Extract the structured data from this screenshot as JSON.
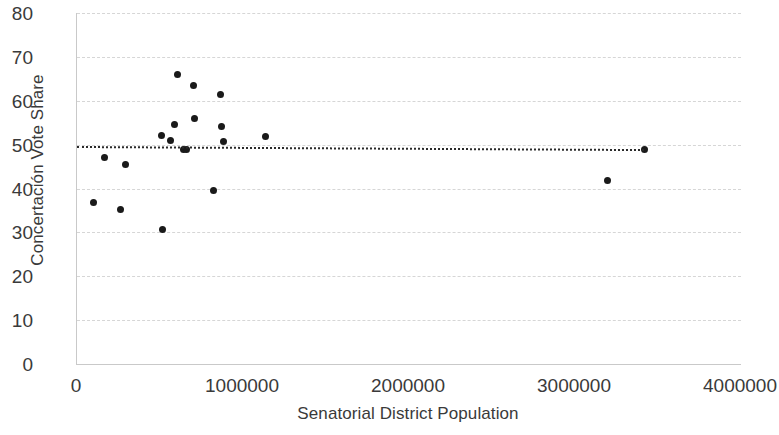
{
  "chart_data": {
    "type": "scatter",
    "title": "",
    "xlabel": "Senatorial District Population",
    "ylabel": "Concertación Vote Share",
    "xlim": [
      0,
      4000000
    ],
    "ylim": [
      0,
      80
    ],
    "xticks": [
      "0",
      "1000000",
      "2000000",
      "3000000",
      "4000000"
    ],
    "xtick_values": [
      0,
      1000000,
      2000000,
      3000000,
      4000000
    ],
    "yticks": [
      "0",
      "10",
      "20",
      "30",
      "40",
      "50",
      "60",
      "70",
      "80"
    ],
    "ytick_values": [
      0,
      10,
      20,
      30,
      40,
      50,
      60,
      70,
      80
    ],
    "grid": true,
    "legend": "none",
    "marker": "filled-circle",
    "marker_color": "#1a1a1a",
    "points": [
      {
        "x": 102000,
        "y": 36.9
      },
      {
        "x": 168000,
        "y": 47.1
      },
      {
        "x": 264000,
        "y": 35.2
      },
      {
        "x": 294000,
        "y": 45.5
      },
      {
        "x": 510000,
        "y": 52.0
      },
      {
        "x": 516000,
        "y": 30.6
      },
      {
        "x": 564000,
        "y": 51.0
      },
      {
        "x": 588000,
        "y": 54.6
      },
      {
        "x": 606000,
        "y": 65.9
      },
      {
        "x": 642000,
        "y": 49.0
      },
      {
        "x": 660000,
        "y": 49.0
      },
      {
        "x": 702000,
        "y": 63.5
      },
      {
        "x": 708000,
        "y": 55.9
      },
      {
        "x": 822000,
        "y": 39.5
      },
      {
        "x": 864000,
        "y": 61.4
      },
      {
        "x": 870000,
        "y": 54.2
      },
      {
        "x": 882000,
        "y": 50.8
      },
      {
        "x": 1134000,
        "y": 51.8
      },
      {
        "x": 3196000,
        "y": 41.9
      },
      {
        "x": 3416000,
        "y": 48.9
      }
    ],
    "trendline": {
      "style": "dotted",
      "color": "#2a2a2a",
      "x_start": 0,
      "x_end": 3416000,
      "y_start": 49.6,
      "y_end": 48.9
    }
  }
}
